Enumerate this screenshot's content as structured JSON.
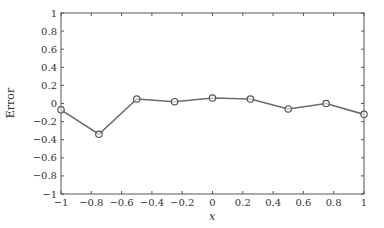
{
  "chart_data": {
    "type": "line",
    "title": "",
    "xlabel": "x",
    "ylabel": "Error",
    "xlim": [
      -1,
      1
    ],
    "ylim": [
      -1,
      1
    ],
    "grid": false,
    "legend": null,
    "x_ticks": [
      -1,
      -0.8,
      -0.6,
      -0.4,
      -0.2,
      0,
      0.2,
      0.4,
      0.6,
      0.8,
      1
    ],
    "x_tick_labels": [
      "−1",
      "−0.8",
      "−0.6",
      "−0.4",
      "−0.2",
      "0",
      "0.2",
      "0.4",
      "0.6",
      "0.8",
      "1"
    ],
    "y_ticks": [
      1,
      0.8,
      0.6,
      0.4,
      0.2,
      0,
      -0.2,
      -0.4,
      -0.6,
      -0.8,
      -1
    ],
    "y_tick_labels": [
      "1",
      "0.8",
      "0.6",
      "0.4",
      "0.2",
      "0",
      "−0.2",
      "−0.4",
      "−0.6",
      "−0.8",
      "−1"
    ],
    "series": [
      {
        "name": "Error",
        "marker": "circle",
        "color": "#666666",
        "x": [
          -1,
          -0.75,
          -0.5,
          -0.25,
          0,
          0.25,
          0.5,
          0.75,
          1
        ],
        "values": [
          -0.07,
          -0.34,
          0.05,
          0.02,
          0.06,
          0.05,
          -0.06,
          0.0,
          -0.12
        ]
      }
    ]
  },
  "colors": {
    "axis": "#555555",
    "line": "#6b6b6b",
    "marker_stroke": "#555555",
    "text": "#333333"
  }
}
